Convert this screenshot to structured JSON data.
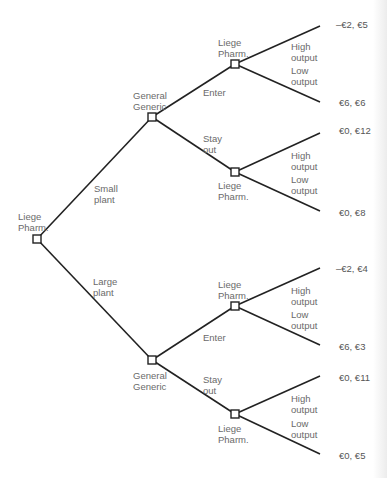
{
  "diagram": {
    "type": "game-tree",
    "root": {
      "player": "Liege\nPharm.",
      "choices": [
        "Small\nplant",
        "Large\nplant"
      ]
    },
    "nodes": {
      "upper_entrant": {
        "player": "General\nGeneric",
        "choices": [
          "Enter",
          "Stay\nout"
        ]
      },
      "lower_entrant": {
        "player": "General\nGeneric",
        "choices": [
          "Enter",
          "Stay\nout"
        ]
      },
      "uu": {
        "player": "Liege\nPharm.",
        "choices": [
          "High\noutput",
          "Low\noutput"
        ]
      },
      "ul": {
        "player": "Liege\nPharm.",
        "choices": [
          "High\noutput",
          "Low\noutput"
        ]
      },
      "lu": {
        "player": "Liege\nPharm.",
        "choices": [
          "High\noutput",
          "Low\noutput"
        ]
      },
      "ll": {
        "player": "Liege\nPharm.",
        "choices": [
          "High\noutput",
          "Low\noutput"
        ]
      }
    },
    "payoffs": [
      "–€2, €5",
      "€6, €6",
      "€0, €12",
      "€0, €8",
      "–€2, €4",
      "€6, €3",
      "€0, €11",
      "€0, €5"
    ]
  }
}
